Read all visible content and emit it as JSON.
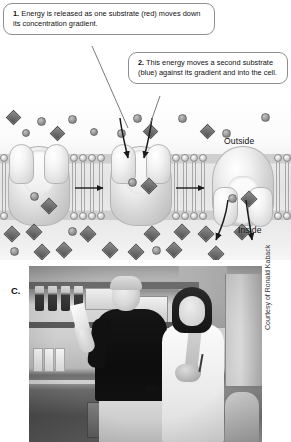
{
  "figure": {
    "panel_label": "C.",
    "credit": "Courtesy of Ronald Kaback"
  },
  "callouts": [
    {
      "number": "1.",
      "text": " Energy is released as one substrate (red) moves down its concentration gradient."
    },
    {
      "number": "2.",
      "text": " This energy moves a second substrate (blue) against its gradient and into the cell."
    }
  ],
  "diagram": {
    "labels": {
      "outside": "Outside",
      "inside": "Inside"
    },
    "colors": {
      "membrane_head": "#9a9a9a",
      "protein": "#d2d2d2",
      "substrate_red_rendered": "#6f6f6f",
      "substrate_blue_rendered": "#4e4e4e",
      "callout_border": "#8f8f8f",
      "text": "#111111"
    },
    "transporters": [
      {
        "state": "open-outward-empty",
        "x": 8
      },
      {
        "state": "open-outward-loaded",
        "x": 110
      },
      {
        "state": "open-inward-releasing",
        "x": 212
      }
    ],
    "outside_particles": [
      {
        "shape": "diamond",
        "x": 8,
        "y": 8,
        "size": 11
      },
      {
        "shape": "circle",
        "x": 37,
        "y": 13,
        "size": 9
      },
      {
        "shape": "circle",
        "x": 22,
        "y": 25,
        "size": 8
      },
      {
        "shape": "diamond",
        "x": 52,
        "y": 24,
        "size": 11
      },
      {
        "shape": "circle",
        "x": 68,
        "y": 11,
        "size": 9
      },
      {
        "shape": "circle",
        "x": 90,
        "y": 24,
        "size": 8
      },
      {
        "shape": "circle",
        "x": 117,
        "y": 25,
        "size": 9
      },
      {
        "shape": "circle",
        "x": 133,
        "y": 10,
        "size": 9
      },
      {
        "shape": "diamond",
        "x": 145,
        "y": 22,
        "size": 11
      },
      {
        "shape": "circle",
        "x": 178,
        "y": 10,
        "size": 9
      },
      {
        "shape": "diamond",
        "x": 202,
        "y": 22,
        "size": 11
      },
      {
        "shape": "circle",
        "x": 222,
        "y": 25,
        "size": 9
      },
      {
        "shape": "circle",
        "x": 261,
        "y": 9,
        "size": 9
      }
    ],
    "inside_particles": [
      {
        "shape": "diamond",
        "x": 6,
        "y": 6,
        "size": 12
      },
      {
        "shape": "diamond",
        "x": 28,
        "y": 4,
        "size": 12
      },
      {
        "shape": "circle",
        "x": 10,
        "y": 25,
        "size": 9
      },
      {
        "shape": "diamond",
        "x": 36,
        "y": 24,
        "size": 12
      },
      {
        "shape": "diamond",
        "x": 58,
        "y": 22,
        "size": 12
      },
      {
        "shape": "circle",
        "x": 68,
        "y": 5,
        "size": 9
      },
      {
        "shape": "diamond",
        "x": 82,
        "y": 6,
        "size": 12
      },
      {
        "shape": "diamond",
        "x": 104,
        "y": 22,
        "size": 12
      },
      {
        "shape": "diamond",
        "x": 130,
        "y": 24,
        "size": 12
      },
      {
        "shape": "diamond",
        "x": 146,
        "y": 6,
        "size": 12
      },
      {
        "shape": "circle",
        "x": 152,
        "y": 24,
        "size": 9
      },
      {
        "shape": "diamond",
        "x": 168,
        "y": 22,
        "size": 12
      },
      {
        "shape": "diamond",
        "x": 176,
        "y": 4,
        "size": 12
      },
      {
        "shape": "diamond",
        "x": 200,
        "y": 6,
        "size": 12
      },
      {
        "shape": "diamond",
        "x": 210,
        "y": 26,
        "size": 12
      },
      {
        "shape": "diamond",
        "x": 236,
        "y": 4,
        "size": 12
      }
    ]
  }
}
